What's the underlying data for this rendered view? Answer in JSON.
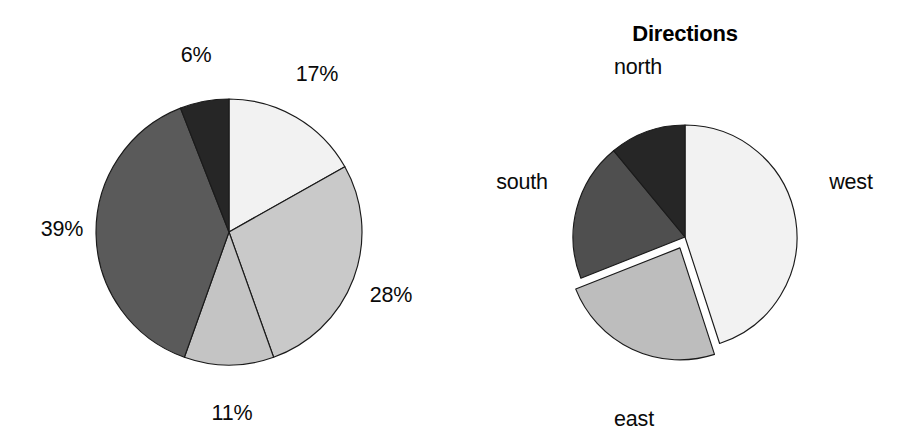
{
  "figure": {
    "background": "#ffffff",
    "width": 904,
    "height": 448
  },
  "chart_data": [
    {
      "id": "left-pie",
      "type": "pie",
      "title": "",
      "labels": [
        "17%",
        "28%",
        "11%",
        "39%",
        "6%"
      ],
      "values": [
        17,
        28,
        11,
        39,
        6
      ],
      "categories": [
        "slice-17",
        "slice-28",
        "slice-11",
        "slice-39",
        "slice-6"
      ],
      "colors": [
        "#f2f2f2",
        "#c9c9c9",
        "#c4c4c4",
        "#5a5a5a",
        "#262626"
      ],
      "start_angle_deg": 0,
      "direction": "clockwise",
      "exploded": [],
      "label_position": "outside",
      "legend": "none",
      "center": [
        229,
        232
      ],
      "radius": 133
    },
    {
      "id": "right-pie",
      "type": "pie",
      "title": "Directions",
      "labels": [
        "west",
        "east",
        "south",
        "north"
      ],
      "values": [
        45,
        24,
        20,
        11
      ],
      "categories": [
        "west",
        "east",
        "south",
        "north"
      ],
      "colors": [
        "#f2f2f2",
        "#bdbdbd",
        "#4f4f4f",
        "#262626"
      ],
      "start_angle_deg": 0,
      "direction": "clockwise",
      "exploded": [
        "east"
      ],
      "explode_offset": 12,
      "label_position": "outside",
      "legend": "none",
      "center": [
        685,
        237
      ],
      "radius": 112
    }
  ],
  "left_chart": {
    "labels": {
      "pct_6": "6%",
      "pct_17": "17%",
      "pct_28": "28%",
      "pct_11": "11%",
      "pct_39": "39%"
    }
  },
  "right_chart": {
    "title": "Directions",
    "labels": {
      "north": "north",
      "west": "west",
      "east": "east",
      "south": "south"
    }
  }
}
